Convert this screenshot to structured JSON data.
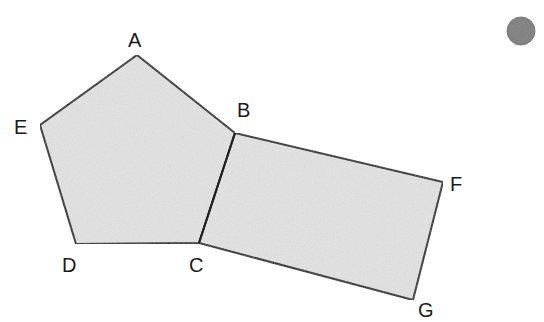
{
  "figure": {
    "background_color": "#ffffff",
    "shape_fill_color": "#e3e3e3",
    "shape_stroke_color": "#1f1f1f",
    "shape_stroke_width": 2,
    "label_color": "#1a1a1a",
    "label_font_size": 20
  },
  "vertices": [
    {
      "id": "A",
      "label": "A",
      "x": 137,
      "y": 55,
      "label_x": 128,
      "label_y": 47
    },
    {
      "id": "B",
      "label": "B",
      "x": 235,
      "y": 133,
      "label_x": 237,
      "label_y": 117
    },
    {
      "id": "C",
      "label": "C",
      "x": 199,
      "y": 243,
      "label_x": 189,
      "label_y": 272
    },
    {
      "id": "D",
      "label": "D",
      "x": 76,
      "y": 244,
      "label_x": 62,
      "label_y": 272
    },
    {
      "id": "E",
      "label": "E",
      "x": 40,
      "y": 125,
      "label_x": 14,
      "label_y": 134
    },
    {
      "id": "F",
      "label": "F",
      "x": 443,
      "y": 182,
      "label_x": 450,
      "label_y": 191
    },
    {
      "id": "G",
      "label": "G",
      "x": 413,
      "y": 300,
      "label_x": 418,
      "label_y": 317
    }
  ],
  "shapes": [
    {
      "id": "pentagon-abcde",
      "name": "pentagon",
      "vertex_ids": [
        "A",
        "B",
        "C",
        "D",
        "E"
      ],
      "points": "137,55 235,133 199,243 76,244 40,125"
    },
    {
      "id": "quadrilateral-bfgc",
      "name": "quadrilateral",
      "vertex_ids": [
        "B",
        "F",
        "G",
        "C"
      ],
      "points": "235,133 443,182 413,300 199,243"
    }
  ],
  "shared_edge": {
    "id": "edge-bc",
    "name": "shared-edge-BC",
    "from": "B",
    "to": "C",
    "x1": 235,
    "y1": 133,
    "x2": 199,
    "y2": 243
  },
  "marker": {
    "id": "gray-dot",
    "name": "gray-circle-marker",
    "cx": 521,
    "cy": 31,
    "r": 14,
    "fill": "#7d7d7d",
    "stroke": "#6e6e6e"
  }
}
